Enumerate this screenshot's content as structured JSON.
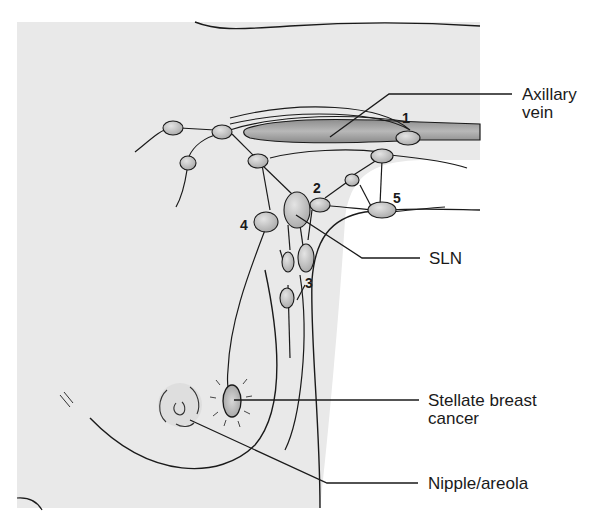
{
  "figure": {
    "colors": {
      "skin_fill": "#e9e9e9",
      "node_fill": "#c9c9c9",
      "vein_fill": "#a9a9a9",
      "outline": "#1a1a1a",
      "background": "#ffffff"
    },
    "labels": [
      {
        "id": "axillary-vein",
        "text": "Axillary\nvein"
      },
      {
        "id": "sln",
        "text": "SLN"
      },
      {
        "id": "stellate-cancer",
        "text": "Stellate breast\ncancer"
      },
      {
        "id": "nipple-areola",
        "text": "Nipple/areola"
      }
    ],
    "node_numbers": [
      "1",
      "2",
      "3",
      "4",
      "5"
    ]
  }
}
